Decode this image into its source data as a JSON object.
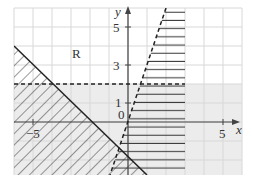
{
  "diagram": {
    "type": "linear-inequality-region",
    "axes": {
      "x_label": "x",
      "y_label": "y",
      "x_range": [
        -6,
        6
      ],
      "y_range": [
        -2.8,
        6
      ],
      "origin_label": "0",
      "x_tick_labels": [
        {
          "value": -5,
          "text": "−5"
        },
        {
          "value": 5,
          "text": "5"
        }
      ],
      "y_tick_labels": [
        {
          "value": 1,
          "text": "1"
        },
        {
          "value": 3,
          "text": "3"
        },
        {
          "value": 5,
          "text": "5"
        }
      ],
      "grid": true
    },
    "lines": [
      {
        "name": "y = -x - 2",
        "style": "solid"
      },
      {
        "name": "y = 2",
        "style": "dashed"
      },
      {
        "name": "y = 3x",
        "style": "dashed"
      }
    ],
    "region_label": "R",
    "colors": {
      "grid": "#d8d8d8",
      "axis": "#444444",
      "line": "#222222",
      "shade": "#ececec",
      "hatch": "#333333"
    }
  }
}
